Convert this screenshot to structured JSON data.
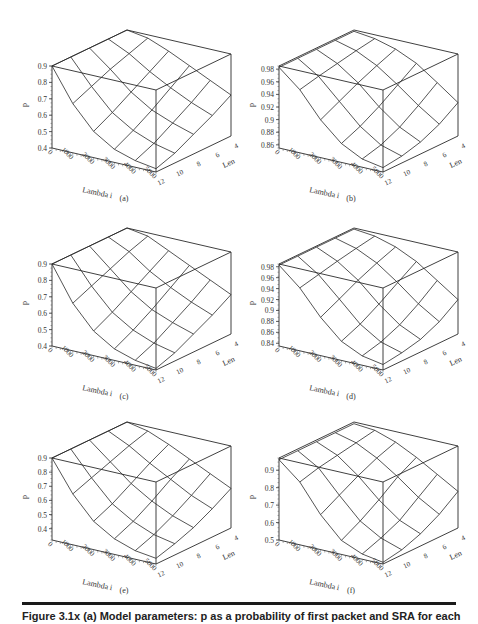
{
  "figure": {
    "caption_partial": "Figure 3.1x  (a) Model parameters: p as a probability of first packet and SRA for each"
  },
  "chart_data": [
    {
      "id": "a",
      "type": "surface3d",
      "label": "(a)",
      "xlabel": "Lambda i",
      "ylabel": "Len",
      "zlabel": "p",
      "x_ticks": [
        "0",
        "1000",
        "2000",
        "3000",
        "4000",
        "5000"
      ],
      "y_ticks": [
        "12",
        "10",
        "8",
        "6",
        "4"
      ],
      "z_ticks": [
        "0.4",
        "0.5",
        "0.6",
        "0.7",
        "0.8",
        "0.9"
      ],
      "zlim": [
        0.4,
        0.9
      ],
      "x": [
        0,
        1000,
        2000,
        3000,
        4000,
        5000
      ],
      "y": [
        12,
        10,
        8,
        6,
        4
      ],
      "z": [
        [
          0.9,
          0.9,
          0.9,
          0.9,
          0.9
        ],
        [
          0.7,
          0.75,
          0.8,
          0.84,
          0.88
        ],
        [
          0.56,
          0.62,
          0.69,
          0.76,
          0.83
        ],
        [
          0.48,
          0.54,
          0.61,
          0.69,
          0.77
        ],
        [
          0.44,
          0.49,
          0.56,
          0.63,
          0.71
        ],
        [
          0.42,
          0.46,
          0.52,
          0.58,
          0.65
        ]
      ]
    },
    {
      "id": "b",
      "type": "surface3d",
      "label": "(b)",
      "xlabel": "Lambda i",
      "ylabel": "Len",
      "zlabel": "p",
      "x_ticks": [
        "0",
        "1000",
        "2000",
        "3000",
        "4000",
        "5000"
      ],
      "y_ticks": [
        "12",
        "10",
        "8",
        "6",
        "4"
      ],
      "z_ticks": [
        "0.86",
        "0.88",
        "0.9",
        "0.92",
        "0.94",
        "0.96",
        "0.98"
      ],
      "zlim": [
        0.855,
        0.985
      ],
      "x": [
        0,
        1000,
        2000,
        3000,
        4000,
        5000
      ],
      "y": [
        12,
        10,
        8,
        6,
        4
      ],
      "z": [
        [
          0.983,
          0.983,
          0.983,
          0.983,
          0.983
        ],
        [
          0.955,
          0.962,
          0.968,
          0.974,
          0.979
        ],
        [
          0.915,
          0.93,
          0.945,
          0.958,
          0.97
        ],
        [
          0.885,
          0.898,
          0.915,
          0.935,
          0.955
        ],
        [
          0.868,
          0.876,
          0.89,
          0.91,
          0.932
        ],
        [
          0.862,
          0.866,
          0.874,
          0.888,
          0.908
        ]
      ]
    },
    {
      "id": "c",
      "type": "surface3d",
      "label": "(c)",
      "xlabel": "Lambda i",
      "ylabel": "Len",
      "zlabel": "p",
      "x_ticks": [
        "0",
        "1000",
        "2000",
        "3000",
        "4000",
        "5000"
      ],
      "y_ticks": [
        "12",
        "10",
        "8",
        "6",
        "4"
      ],
      "z_ticks": [
        "0.4",
        "0.5",
        "0.6",
        "0.7",
        "0.8",
        "0.9"
      ],
      "zlim": [
        0.4,
        0.9
      ],
      "x": [
        0,
        1000,
        2000,
        3000,
        4000,
        5000
      ],
      "y": [
        12,
        10,
        8,
        6,
        4
      ],
      "z": [
        [
          0.9,
          0.9,
          0.9,
          0.9,
          0.9
        ],
        [
          0.69,
          0.74,
          0.79,
          0.84,
          0.88
        ],
        [
          0.55,
          0.61,
          0.68,
          0.75,
          0.82
        ],
        [
          0.47,
          0.53,
          0.6,
          0.68,
          0.76
        ],
        [
          0.43,
          0.48,
          0.55,
          0.62,
          0.7
        ],
        [
          0.41,
          0.45,
          0.51,
          0.57,
          0.64
        ]
      ]
    },
    {
      "id": "d",
      "type": "surface3d",
      "label": "(d)",
      "xlabel": "Lambda i",
      "ylabel": "Len",
      "zlabel": "p",
      "x_ticks": [
        "0",
        "1000",
        "2000",
        "3000",
        "4000",
        "5000"
      ],
      "y_ticks": [
        "12",
        "10",
        "8",
        "6",
        "4"
      ],
      "z_ticks": [
        "0.84",
        "0.86",
        "0.88",
        "0.9",
        "0.92",
        "0.94",
        "0.96",
        "0.98"
      ],
      "zlim": [
        0.835,
        0.985
      ],
      "x": [
        0,
        1000,
        2000,
        3000,
        4000,
        5000
      ],
      "y": [
        12,
        10,
        8,
        6,
        4
      ],
      "z": [
        [
          0.983,
          0.983,
          0.983,
          0.983,
          0.983
        ],
        [
          0.95,
          0.958,
          0.966,
          0.973,
          0.979
        ],
        [
          0.905,
          0.922,
          0.94,
          0.955,
          0.968
        ],
        [
          0.87,
          0.885,
          0.905,
          0.928,
          0.95
        ],
        [
          0.852,
          0.861,
          0.876,
          0.898,
          0.924
        ],
        [
          0.845,
          0.85,
          0.858,
          0.874,
          0.898
        ]
      ]
    },
    {
      "id": "e",
      "type": "surface3d",
      "label": "(e)",
      "xlabel": "Lambda i",
      "ylabel": "Len",
      "zlabel": "p",
      "x_ticks": [
        "0",
        "1000",
        "2000",
        "3000",
        "4000",
        "5000"
      ],
      "y_ticks": [
        "12",
        "10",
        "8",
        "6",
        "4"
      ],
      "z_ticks": [
        "0.4",
        "0.5",
        "0.6",
        "0.7",
        "0.8",
        "0.9"
      ],
      "zlim": [
        0.32,
        0.9
      ],
      "x": [
        0,
        1000,
        2000,
        3000,
        4000,
        5000
      ],
      "y": [
        12,
        10,
        8,
        6,
        4
      ],
      "z": [
        [
          0.9,
          0.9,
          0.9,
          0.9,
          0.9
        ],
        [
          0.68,
          0.73,
          0.78,
          0.83,
          0.87
        ],
        [
          0.52,
          0.58,
          0.66,
          0.74,
          0.81
        ],
        [
          0.43,
          0.49,
          0.57,
          0.66,
          0.74
        ],
        [
          0.38,
          0.43,
          0.5,
          0.58,
          0.67
        ],
        [
          0.36,
          0.4,
          0.45,
          0.52,
          0.6
        ]
      ]
    },
    {
      "id": "f",
      "type": "surface3d",
      "label": "(f)",
      "xlabel": "Lambda i",
      "ylabel": "Len",
      "zlabel": "p",
      "x_ticks": [
        "0",
        "1000",
        "2000",
        "3000",
        "4000",
        "5000"
      ],
      "y_ticks": [
        "12",
        "10",
        "8",
        "6",
        "4"
      ],
      "z_ticks": [
        "0.5",
        "0.6",
        "0.7",
        "0.8",
        "0.9"
      ],
      "zlim": [
        0.5,
        0.97
      ],
      "x": [
        0,
        1000,
        2000,
        3000,
        4000,
        5000
      ],
      "y": [
        12,
        10,
        8,
        6,
        4
      ],
      "z": [
        [
          0.96,
          0.96,
          0.96,
          0.96,
          0.96
        ],
        [
          0.86,
          0.89,
          0.91,
          0.93,
          0.95
        ],
        [
          0.7,
          0.76,
          0.82,
          0.87,
          0.91
        ],
        [
          0.58,
          0.64,
          0.71,
          0.79,
          0.85
        ],
        [
          0.53,
          0.57,
          0.62,
          0.7,
          0.78
        ],
        [
          0.51,
          0.53,
          0.57,
          0.63,
          0.71
        ]
      ]
    }
  ]
}
